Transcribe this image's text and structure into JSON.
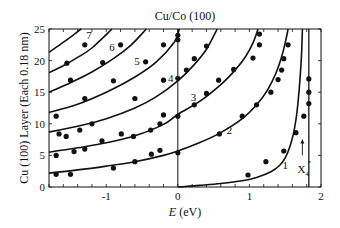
{
  "chart_data": {
    "type": "scatter",
    "title": "Cu/Co (100)",
    "xlabel_italic": "E",
    "xlabel_unit": " (eV)",
    "xlabel": "E (eV)",
    "ylabel": "Cu (100) Layer (Each 0.18 nm)",
    "xlim": [
      -1.8,
      2.0
    ],
    "ylim": [
      0,
      25
    ],
    "xticks": [
      -1,
      0,
      1,
      2
    ],
    "xtick_labels": [
      "-1",
      "0",
      "1",
      "2"
    ],
    "yticks": [
      0,
      5,
      10,
      15,
      20,
      25
    ],
    "ytick_labels": [
      "0",
      "5",
      "10",
      "15",
      "20",
      "25"
    ],
    "grid": false,
    "vertical_lines": [
      {
        "x": 0,
        "label": ""
      },
      {
        "x": 1.83,
        "label": "X4'"
      }
    ],
    "annotation": {
      "text": "X",
      "sub": "4",
      "sup": "'",
      "x": 1.72,
      "y": 2.8,
      "arrow_from_y": 5.0,
      "arrow_to_y": 7.5
    },
    "series": [
      {
        "name": "1",
        "type": "line",
        "label_at": [
          1.5,
          3.5
        ],
        "x": [
          0.0,
          0.3,
          0.6,
          0.9,
          1.1,
          1.3,
          1.42,
          1.5,
          1.56,
          1.61,
          1.65,
          1.68,
          1.71,
          1.73,
          1.74
        ],
        "y": [
          0.0,
          0.25,
          0.55,
          1.0,
          1.5,
          2.4,
          3.4,
          4.6,
          6.2,
          8.2,
          10.6,
          13.5,
          17.5,
          21.5,
          25.0
        ]
      },
      {
        "name": "2",
        "type": "line",
        "label_at": [
          0.72,
          9.0
        ],
        "x": [
          -1.8,
          -1.4,
          -1.0,
          -0.6,
          -0.2,
          0.0,
          0.3,
          0.6,
          0.9,
          1.1,
          1.25,
          1.37,
          1.45,
          1.5,
          1.54
        ],
        "y": [
          2.2,
          2.7,
          3.3,
          4.0,
          5.0,
          5.7,
          7.0,
          8.6,
          10.8,
          13.0,
          15.3,
          18.0,
          20.6,
          22.8,
          25.0
        ]
      },
      {
        "name": "3",
        "type": "line",
        "label_at": [
          0.22,
          14.2
        ],
        "x": [
          -1.8,
          -1.4,
          -1.0,
          -0.6,
          -0.2,
          0.0,
          0.3,
          0.6,
          0.8,
          0.95,
          1.05,
          1.12
        ],
        "y": [
          5.5,
          6.2,
          7.0,
          8.1,
          9.9,
          11.5,
          13.5,
          16.2,
          18.5,
          20.7,
          22.8,
          25.0
        ]
      },
      {
        "name": "4",
        "type": "line",
        "label_at": [
          -0.1,
          17.3
        ],
        "x": [
          -1.8,
          -1.4,
          -1.0,
          -0.6,
          -0.3,
          0.0,
          0.2,
          0.4,
          0.55
        ],
        "y": [
          8.7,
          9.6,
          10.8,
          12.5,
          14.3,
          16.8,
          19.0,
          21.8,
          25.0
        ]
      },
      {
        "name": "5",
        "type": "line",
        "label_at": [
          -0.57,
          20.0
        ],
        "x": [
          -1.8,
          -1.4,
          -1.0,
          -0.6,
          -0.3,
          -0.05,
          0.02
        ],
        "y": [
          11.8,
          13.1,
          15.0,
          17.4,
          19.8,
          22.9,
          25.0
        ]
      },
      {
        "name": "6",
        "type": "line",
        "label_at": [
          -0.92,
          22.2
        ],
        "x": [
          -1.8,
          -1.5,
          -1.2,
          -0.9,
          -0.65,
          -0.44
        ],
        "y": [
          15.0,
          16.5,
          18.2,
          20.3,
          22.5,
          25.0
        ]
      },
      {
        "name": "7",
        "type": "line",
        "label_at": [
          -1.24,
          24.0
        ],
        "x": [
          -1.8,
          -1.6,
          -1.4,
          -1.2,
          -0.92
        ],
        "y": [
          18.1,
          19.2,
          20.5,
          22.0,
          25.0
        ]
      },
      {
        "name": "8",
        "type": "line",
        "label_at": null,
        "x": [
          -1.8,
          -1.65,
          -1.5,
          -1.35
        ],
        "y": [
          21.3,
          22.5,
          23.7,
          25.0
        ]
      },
      {
        "name": "measured",
        "type": "scatter",
        "x": [
          -1.7,
          -1.5,
          -0.9,
          -0.6,
          -0.37,
          -0.25,
          0.0,
          0.98,
          1.23,
          1.48,
          1.65,
          1.76,
          1.83,
          1.83,
          1.83,
          -1.7,
          -1.45,
          -1.3,
          -1.06,
          -0.79,
          -0.62,
          -0.38,
          -0.25,
          0.58,
          0.9,
          1.1,
          -1.7,
          -1.66,
          -1.56,
          -1.37,
          -1.2,
          -0.2,
          0.0,
          0.23,
          0.4,
          0.57,
          0.78,
          1.05,
          1.14,
          1.14,
          1.3,
          1.4,
          1.45,
          1.48,
          1.54,
          -1.3,
          -0.6,
          -0.2,
          0.0,
          0.12,
          0.23,
          0.4,
          -1.5,
          -0.9,
          -0.45,
          -0.2,
          0.0,
          0.0,
          -1.55,
          -1.05,
          -0.8,
          -1.3
        ],
        "y": [
          2.0,
          2.0,
          3.0,
          4.0,
          5.2,
          5.8,
          5.4,
          1.9,
          4.0,
          5.7,
          8.6,
          11.2,
          13.2,
          15.0,
          17.1,
          5.0,
          5.6,
          6.0,
          7.3,
          8.4,
          8.0,
          9.0,
          10.0,
          8.4,
          11.2,
          13.0,
          11.2,
          8.4,
          8.0,
          9.0,
          10.0,
          11.4,
          11.2,
          13.0,
          14.8,
          16.9,
          18.6,
          20.4,
          24.2,
          22.5,
          15.0,
          17.0,
          18.5,
          20.3,
          22.5,
          14.0,
          14.0,
          16.9,
          17.2,
          18.5,
          20.3,
          22.3,
          16.9,
          16.8,
          19.8,
          22.5,
          23.3,
          24.0,
          19.6,
          19.7,
          22.5,
          22.5
        ]
      }
    ]
  }
}
